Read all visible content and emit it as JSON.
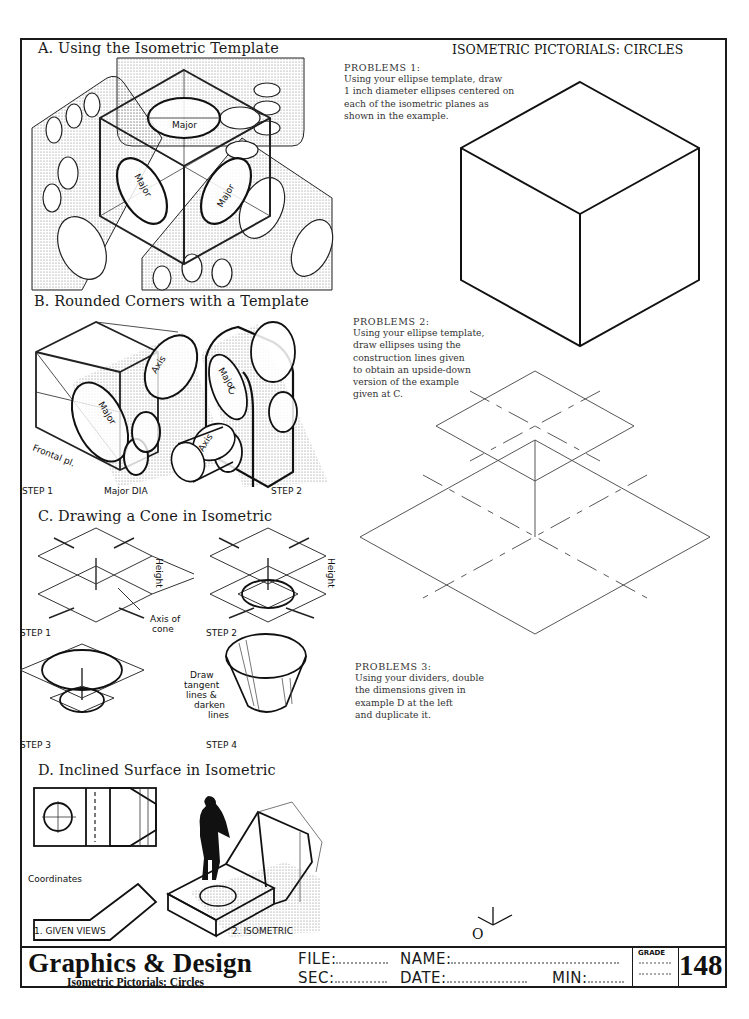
{
  "sheet": {
    "title": "ISOMETRIC PICTORIALS: CIRCLES",
    "page_number": "148"
  },
  "sections": {
    "a": {
      "title": "A. Using the Isometric Template",
      "labels": [
        "Major",
        "Major",
        "Major"
      ]
    },
    "b": {
      "title": "B. Rounded Corners with a Template",
      "labels": {
        "axis_1": "Axis",
        "major_1": "Major",
        "frontal": "Frontal pl.",
        "major_dia": "Major DIA",
        "axis_2": "Axis",
        "major_2": "Major",
        "c": "C",
        "step_1": "STEP 1",
        "step_2": "STEP 2"
      }
    },
    "c": {
      "title": "C. Drawing a Cone in Isometric",
      "labels": {
        "height_1": "Height",
        "height_2": "Height",
        "axis_of": "Axis of",
        "cone": "cone",
        "step_1": "STEP 1",
        "step_2": "STEP 2",
        "step_3": "STEP 3",
        "step_4": "STEP 4",
        "draw": "Draw",
        "tangent": "tangent",
        "lines_amp": "lines &",
        "darken": "darken",
        "lines": "lines"
      }
    },
    "d": {
      "title": "D. Inclined Surface in Isometric",
      "labels": {
        "coordinates": "Coordinates",
        "given_views": "1. GIVEN VIEWS",
        "isometric": "2. ISOMETRIC"
      }
    }
  },
  "problems": [
    {
      "heading": "PROBLEMS 1:",
      "lines": [
        "Using your ellipse template, draw",
        "1 inch diameter ellipses centered on",
        "each of the isometric planes as",
        "shown in the example."
      ]
    },
    {
      "heading": "PROBLEMS 2:",
      "lines": [
        "Using your ellipse template,",
        "draw ellipses using the",
        "construction lines given",
        "to obtain an upside-down",
        "version of the example",
        "given at C."
      ]
    },
    {
      "heading": "PROBLEMS 3:",
      "lines": [
        "Using your dividers, double",
        "the dimensions given in",
        "example D at the left",
        "and duplicate it."
      ]
    }
  ],
  "axis_symbol": {
    "label": "O"
  },
  "title_block": {
    "brand": "Graphics & Design",
    "subtitle": "Isometric Pictorials: Circles",
    "file_label": "FILE:",
    "name_label": "NAME:",
    "sec_label": "SEC:",
    "date_label": "DATE:",
    "min_label": "MIN:",
    "grade_label": "GRADE",
    "file_value": "",
    "name_value": "",
    "sec_value": "",
    "date_value": "",
    "min_value": "",
    "grade_value": ""
  }
}
